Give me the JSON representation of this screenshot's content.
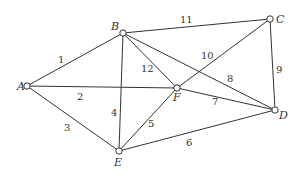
{
  "graph": {
    "nodes": [
      {
        "id": "A",
        "x": 27,
        "y": 86,
        "lx": 17,
        "ly": 90
      },
      {
        "id": "B",
        "x": 123,
        "y": 33,
        "lx": 111,
        "ly": 30
      },
      {
        "id": "C",
        "x": 270,
        "y": 19,
        "lx": 276,
        "ly": 23
      },
      {
        "id": "D",
        "x": 275,
        "y": 110,
        "lx": 279,
        "ly": 119
      },
      {
        "id": "E",
        "x": 119,
        "y": 151,
        "lx": 114,
        "ly": 166
      },
      {
        "id": "F",
        "x": 177,
        "y": 88,
        "lx": 173,
        "ly": 101
      }
    ],
    "edges": [
      {
        "from": "A",
        "to": "B",
        "weight": "1",
        "lx": 58,
        "ly": 63
      },
      {
        "from": "A",
        "to": "F",
        "weight": "2",
        "lx": 77,
        "ly": 100
      },
      {
        "from": "A",
        "to": "E",
        "weight": "3",
        "lx": 64,
        "ly": 131
      },
      {
        "from": "B",
        "to": "E",
        "weight": "4",
        "lx": 111,
        "ly": 116
      },
      {
        "from": "E",
        "to": "F",
        "weight": "5",
        "lx": 148,
        "ly": 127
      },
      {
        "from": "E",
        "to": "D",
        "weight": "6",
        "lx": 186,
        "ly": 146
      },
      {
        "from": "F",
        "to": "D",
        "weight": "7",
        "lx": 212,
        "ly": 105
      },
      {
        "from": "B",
        "to": "D",
        "weight": "8",
        "lx": 227,
        "ly": 82
      },
      {
        "from": "C",
        "to": "D",
        "weight": "9",
        "lx": 276,
        "ly": 73
      },
      {
        "from": "F",
        "to": "C",
        "weight": "10",
        "lx": 201,
        "ly": 59
      },
      {
        "from": "B",
        "to": "C",
        "weight": "11",
        "lx": 180,
        "ly": 23
      },
      {
        "from": "B",
        "to": "F",
        "weight": "12",
        "lx": 141,
        "ly": 72
      }
    ]
  }
}
